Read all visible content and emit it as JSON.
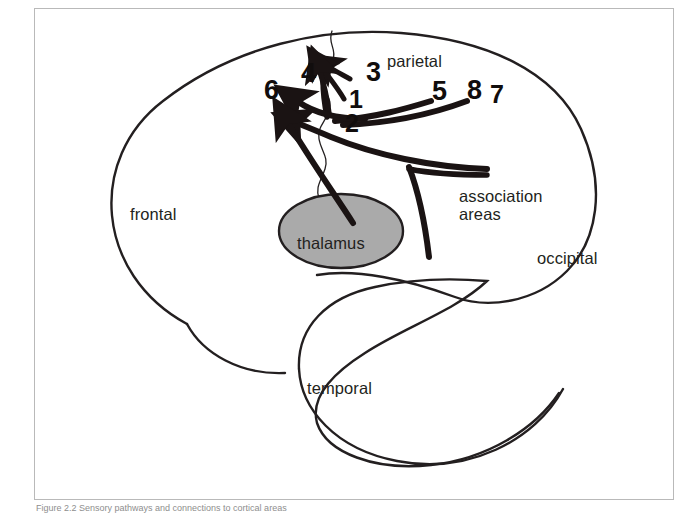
{
  "figure": {
    "type": "brain-schematic-diagram",
    "background_color": "#ffffff",
    "frame_color": "#b9b9b9",
    "outline_color": "#231f20",
    "arrow_color": "#1a1313",
    "thalamus_fill": "#aaaaaa"
  },
  "region_labels": [
    {
      "id": "frontal",
      "text": "frontal",
      "x": 95,
      "y": 203
    },
    {
      "id": "parietal",
      "text": "parietal",
      "x": 352,
      "y": 50
    },
    {
      "id": "occipital",
      "text": "occipital",
      "x": 502,
      "y": 247
    },
    {
      "id": "temporal",
      "text": "temporal",
      "x": 272,
      "y": 377
    },
    {
      "id": "thalamus",
      "text": "thalamus",
      "x": 299,
      "y": 233
    }
  ],
  "callout_labels": [
    {
      "id": "association-areas",
      "line1": "association",
      "line2": "areas",
      "x": 424,
      "y": 186
    }
  ],
  "pathway_numbers": [
    {
      "id": "num-6",
      "text": "6",
      "x": 229,
      "y": 74,
      "size": 27
    },
    {
      "id": "num-4",
      "text": "4",
      "x": 266,
      "y": 57,
      "size": 27
    },
    {
      "id": "num-3",
      "text": "3",
      "x": 331,
      "y": 56,
      "size": 27
    },
    {
      "id": "num-1",
      "text": "1",
      "x": 314,
      "y": 82,
      "size": 25
    },
    {
      "id": "num-2",
      "text": "2",
      "x": 310,
      "y": 106,
      "size": 25
    },
    {
      "id": "num-5",
      "text": "5",
      "x": 397,
      "y": 75,
      "size": 27
    },
    {
      "id": "num-8",
      "text": "8",
      "x": 432,
      "y": 74,
      "size": 27
    },
    {
      "id": "num-7",
      "text": "7",
      "x": 455,
      "y": 78,
      "size": 25
    }
  ],
  "caption": {
    "text": "Figure 2.2 Sensory pathways and connections to cortical areas",
    "clipped": true
  }
}
